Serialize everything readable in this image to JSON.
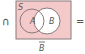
{
  "diagram": {
    "operator": "∩",
    "equals": "=",
    "universe_label": "S",
    "set_a_label": "A",
    "set_b_label": "B",
    "caption": "B̄",
    "caption_base": "B",
    "shaded_region": "complement of B",
    "colors": {
      "shade": "#f4c9c9",
      "stroke": "#8a7a7a",
      "text": "#555555"
    }
  }
}
